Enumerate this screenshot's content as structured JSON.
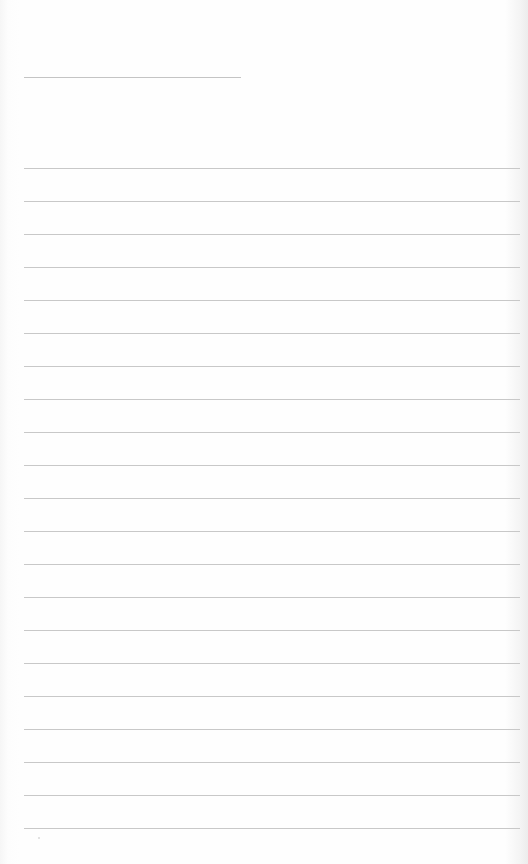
{
  "page": {
    "type": "lined-paper",
    "background_color": "#fefefe",
    "line_color": "#c8c8c8",
    "title_line": {
      "text": ""
    },
    "ruled_lines": [
      {
        "text": ""
      },
      {
        "text": ""
      },
      {
        "text": ""
      },
      {
        "text": ""
      },
      {
        "text": ""
      },
      {
        "text": ""
      },
      {
        "text": ""
      },
      {
        "text": ""
      },
      {
        "text": ""
      },
      {
        "text": ""
      },
      {
        "text": ""
      },
      {
        "text": ""
      },
      {
        "text": ""
      },
      {
        "text": ""
      },
      {
        "text": ""
      },
      {
        "text": ""
      },
      {
        "text": ""
      },
      {
        "text": ""
      },
      {
        "text": ""
      },
      {
        "text": ""
      },
      {
        "text": ""
      }
    ]
  }
}
